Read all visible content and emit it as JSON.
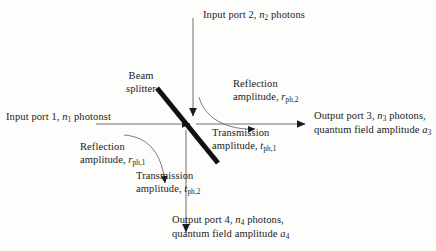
{
  "figure": {
    "kind": "beam-splitter-schematic",
    "background_color": "#fdfdfc",
    "ink_color": "#1b1b1b",
    "beam_splitter_color": "#111111"
  },
  "labels": {
    "input_port_2": "Input port 2, n2 photons",
    "input_port_1": "Input port 1, n1 photonst",
    "output_port_3_line1": "Output port 3, n3 photons,",
    "output_port_3_line2": "quantum field amplitude a3",
    "output_port_4_line1": "Output port 4, n4 photons,",
    "output_port_4_line2": "quantum field amplitude a4",
    "beam_splitter_line1": "Beam",
    "beam_splitter_line2": "splitter",
    "reflection_2_line1": "Reflection",
    "reflection_2_line2": "amplitude, rph,2",
    "transmission_1_line1": "Transmission",
    "transmission_1_line2": "amplitude, tph,1",
    "reflection_1_line1": "Reflection",
    "reflection_1_line2": "amplitude, rph,1",
    "transmission_2_line1": "Transmission",
    "transmission_2_line2": "amplitude, tph,2"
  },
  "symbols": {
    "n": "n",
    "a": "a",
    "r": "r",
    "t": "t",
    "sub_1": "1",
    "sub_2": "2",
    "sub_3": "3",
    "sub_4": "4",
    "sub_ph1": "ph,1",
    "sub_ph2": "ph,2"
  },
  "text_fragments": {
    "input_port_prefix_2": "Input port 2, ",
    "input_port_suffix_2": " photons",
    "input_port_prefix_1": "Input port 1, ",
    "input_port_suffix_1": " photonst",
    "output_port_prefix_3": "Output port 3, ",
    "output_port_suffix_3": " photons,",
    "output_port_prefix_4": "Output port 4, ",
    "output_port_suffix_4": " photons,",
    "quantum_field_prefix": "quantum field amplitude ",
    "reflection_word": "Reflection",
    "transmission_word": "Transmission",
    "amplitude_prefix": "amplitude, "
  },
  "geometry": {
    "beam_splitter": {
      "x1": 157,
      "y1": 88,
      "x2": 218,
      "y2": 163,
      "stroke_width": 5
    },
    "input_arrow_1": {
      "x1": 96,
      "y1": 124,
      "x2": 195,
      "y2": 124
    },
    "input_arrow_2": {
      "x1": 193,
      "y1": 18,
      "x2": 193,
      "y2": 120
    },
    "output_arrow_3": {
      "x1": 196,
      "y1": 124,
      "x2": 310,
      "y2": 124
    },
    "output_arrow_4": {
      "x1": 186,
      "y1": 130,
      "x2": 186,
      "y2": 237
    },
    "arc_reflection_2": {
      "from": [
        200,
        100
      ],
      "to": [
        262,
        128
      ]
    },
    "arc_reflection_1": {
      "from": [
        124,
        136
      ],
      "to": [
        167,
        190
      ]
    }
  }
}
